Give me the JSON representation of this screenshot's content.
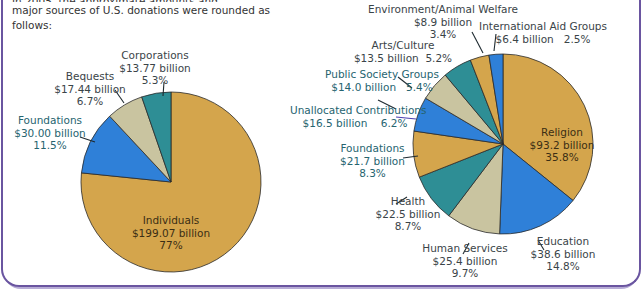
{
  "intro": {
    "line0": "In 2005, the approximate amounts and percentages for the",
    "line1": "major sources of U.S. donations were rounded as",
    "line2": "follows:"
  },
  "colors": {
    "gold": "#D4A54C",
    "blue": "#2F80D8",
    "beige": "#C9C4A0",
    "teal": "#2E8E95",
    "border": "#6A55A0"
  },
  "chart_data": [
    {
      "type": "pie",
      "title": "Sources of U.S. Donations",
      "categories": [
        "Individuals",
        "Foundations",
        "Bequests",
        "Corporations"
      ],
      "amounts_billion": [
        199.07,
        30.0,
        17.44,
        13.77
      ],
      "values": [
        77,
        11.5,
        6.7,
        5.3
      ],
      "colors": [
        "#D4A54C",
        "#2F80D8",
        "#C9C4A0",
        "#2E8E95"
      ]
    },
    {
      "type": "pie",
      "title": "Uses of U.S. Donations",
      "categories": [
        "Religion",
        "Education",
        "Human Services",
        "Health",
        "Foundations",
        "Unallocated Contributions",
        "Public Society Groups",
        "Arts/Culture",
        "Environment/Animal Welfare",
        "International Aid Groups"
      ],
      "amounts_billion": [
        93.2,
        38.6,
        25.4,
        22.5,
        21.7,
        16.5,
        14.0,
        13.5,
        8.9,
        6.4
      ],
      "values": [
        35.8,
        14.8,
        9.7,
        8.7,
        8.3,
        6.2,
        5.4,
        5.2,
        3.4,
        2.5
      ],
      "colors": [
        "#D4A54C",
        "#2F80D8",
        "#C9C4A0",
        "#2E8E95",
        "#D4A54C",
        "#2F80D8",
        "#C9C4A0",
        "#2E8E95",
        "#D4A54C",
        "#2F80D8"
      ]
    }
  ],
  "left_labels": {
    "individuals": {
      "name": "Individuals",
      "amount": "$199.07 billion",
      "pct": "77%"
    },
    "foundations": {
      "name": "Foundations",
      "amount": "$30.00 billion",
      "pct": "11.5%"
    },
    "bequests": {
      "name": "Bequests",
      "amount": "$17.44 billion",
      "pct": "6.7%"
    },
    "corporations": {
      "name": "Corporations",
      "amount": "$13.77 billion",
      "pct": "5.3%"
    }
  },
  "right_labels": {
    "religion": {
      "name": "Religion",
      "amount": "$93.2 billion",
      "pct": "35.8%"
    },
    "education": {
      "name": "Education",
      "amount": "$38.6 billion",
      "pct": "14.8%"
    },
    "human": {
      "name": "Human Services",
      "amount": "$25.4 billion",
      "pct": "9.7%"
    },
    "health": {
      "name": "Health",
      "amount": "$22.5 billion",
      "pct": "8.7%"
    },
    "foundations": {
      "name": "Foundations",
      "amount": "$21.7 billion",
      "pct": "8.3%"
    },
    "unallocated": {
      "name": "Unallocated Contributions",
      "line2": "$16.5 billion    6.2%"
    },
    "public": {
      "name": "Public Society Groups",
      "line2": "$14.0 billion   5.4%"
    },
    "arts": {
      "name": "Arts/Culture",
      "line2": "$13.5 billion  5.2%"
    },
    "environment": {
      "name": "Environment/Animal Welfare",
      "amount": "$8.9 billion",
      "pct": "3.4%"
    },
    "international": {
      "name": "International Aid Groups",
      "line2": "$6.4 billion   2.5%"
    }
  }
}
